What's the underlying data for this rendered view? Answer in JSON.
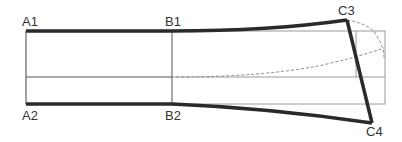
{
  "diagram": {
    "type": "pattern-draft",
    "labels": {
      "a1": "A1",
      "b1": "B1",
      "c3": "C3",
      "a2": "A2",
      "b2": "B2",
      "c4": "C4"
    },
    "colors": {
      "outline": "#2a2a2a",
      "guide": "#555555",
      "guide_light": "#9a9a9a",
      "dashed": "#8a8a8a",
      "background": "#ffffff"
    }
  }
}
